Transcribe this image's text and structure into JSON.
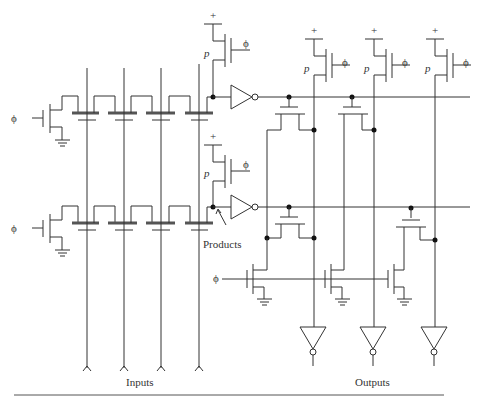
{
  "diagram": {
    "type": "dynamic CMOS PLA circuit schematic",
    "labels": {
      "clock": "ϕ",
      "pmos": "p",
      "supply": "+",
      "products": "Products",
      "inputs": "Inputs",
      "outputs": "Outputs"
    },
    "caption": "Figure ... (caption cut off)",
    "colors": {
      "line": "#333333",
      "background": "#ffffff"
    },
    "structure": {
      "input_lines": 4,
      "product_terms": 2,
      "output_lines": 3,
      "and_plane_transistors_per_row": 4,
      "precharge_pmos": 5,
      "output_inverters": 3
    }
  }
}
